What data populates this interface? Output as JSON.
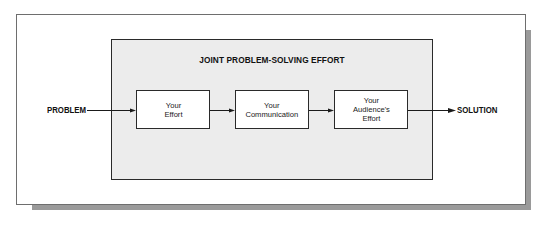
{
  "diagram": {
    "title": "JOINT PROBLEM-SOLVING EFFORT",
    "input_label": "PROBLEM",
    "output_label": "SOLUTION",
    "steps": [
      {
        "label": "Your\nEffort"
      },
      {
        "label": "Your\nCommunication"
      },
      {
        "label": "Your\nAudience's\nEffort"
      }
    ],
    "flow": [
      "PROBLEM",
      "Your Effort",
      "Your Communication",
      "Your Audience's Effort",
      "SOLUTION"
    ]
  },
  "colors": {
    "panel_fill": "#ececec",
    "box_fill": "#ffffff",
    "stroke": "#2a2a2a",
    "shadow": "#9a9a9a",
    "frame": "#6e6e6e"
  }
}
